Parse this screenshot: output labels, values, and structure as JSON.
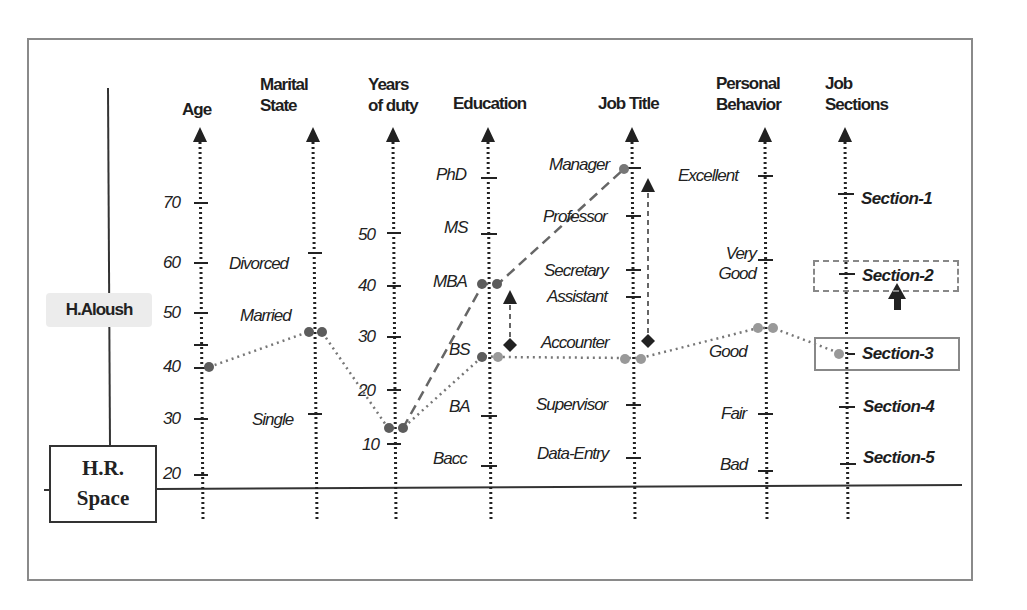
{
  "diagram": {
    "space_label": "H.R.\nSpace",
    "employee_name": "H.Aloush",
    "colors": {
      "axis": "#222222",
      "frame": "#8a8a8a",
      "point_dark": "#666666",
      "point_light": "#999999",
      "highlight_bg": "#ececec"
    },
    "axes": [
      {
        "id": "age",
        "title": "Age",
        "ticks": [
          "70",
          "60",
          "50",
          "40",
          "30",
          "20"
        ]
      },
      {
        "id": "marital",
        "title": "Marital\nState",
        "ticks": [
          "Divorced",
          "Married",
          "Single"
        ]
      },
      {
        "id": "years",
        "title": "Years\nof duty",
        "ticks": [
          "50",
          "40",
          "30",
          "20",
          "10"
        ]
      },
      {
        "id": "education",
        "title": "Education",
        "ticks": [
          "PhD",
          "MS",
          "MBA",
          "BS",
          "BA",
          "Bacc"
        ]
      },
      {
        "id": "job_title",
        "title": "Job Title",
        "ticks": [
          "Manager",
          "Professor",
          "Secretary",
          "Assistant",
          "Accounter",
          "Supervisor",
          "Data-Entry"
        ]
      },
      {
        "id": "behavior",
        "title": "Personal\nBehavior",
        "ticks": [
          "Excellent",
          "Very\nGood",
          "Good",
          "Fair",
          "Bad"
        ]
      },
      {
        "id": "sections",
        "title": "Job\nSections",
        "ticks": [
          "Section-1",
          "Section-2",
          "Section-3",
          "Section-4",
          "Section-5"
        ]
      }
    ],
    "current_profile": {
      "age": "40",
      "marital": "Married",
      "years": "~13",
      "education": "BS",
      "job_title": "Accounter",
      "behavior": "Good",
      "section": "Section-3"
    },
    "target_profile": {
      "education": "MBA",
      "job_title": "Manager",
      "section": "Section-2"
    },
    "annotations": {
      "current_section_boxed": "Section-3",
      "target_section_dashed_box": "Section-2",
      "promotion_arrow": "Section-3 → Section-2"
    }
  }
}
